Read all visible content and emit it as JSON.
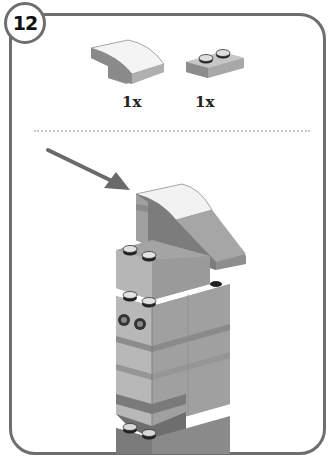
{
  "step": {
    "number": "12"
  },
  "parts_list": [
    {
      "name": "curved-slope-2x2",
      "quantity": "1x"
    },
    {
      "name": "plate-1x2",
      "quantity": "1x"
    }
  ],
  "colors": {
    "frame": "#6e6e6e",
    "brick_light": "#b4b4b4",
    "brick_mid": "#9a9a9a",
    "brick_dark": "#7c7c7c",
    "arrow": "#6a6a6a"
  }
}
